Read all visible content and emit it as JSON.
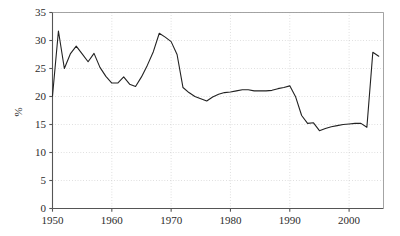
{
  "chart_data": {
    "type": "line",
    "title": "",
    "subtitle": "",
    "xlabel": "",
    "ylabel": "%",
    "xlim": [
      1950,
      2005.8
    ],
    "ylim": [
      0,
      35
    ],
    "xticks": [
      1950,
      1960,
      1970,
      1980,
      1990,
      2000
    ],
    "xtick_labels": [
      "1950",
      "1960",
      "1970",
      "1980",
      "1990",
      "2000"
    ],
    "yticks": [
      0,
      5,
      10,
      15,
      20,
      25,
      30,
      35
    ],
    "ytick_labels": [
      "0",
      "5",
      "10",
      "15",
      "20",
      "25",
      "30",
      "35"
    ],
    "grid": true,
    "grid_style": "dotted",
    "grid_color": "#c8c8c8",
    "legend": "none",
    "line_color": "#222222",
    "line_width": 1.1,
    "axis_color": "#555555",
    "background": "#ffffff",
    "x": [
      1950,
      1951,
      1952,
      1953,
      1954,
      1955,
      1956,
      1957,
      1958,
      1959,
      1960,
      1961,
      1962,
      1963,
      1964,
      1965,
      1966,
      1967,
      1968,
      1969,
      1970,
      1971,
      1972,
      1973,
      1974,
      1975,
      1976,
      1977,
      1978,
      1979,
      1980,
      1981,
      1982,
      1983,
      1984,
      1985,
      1986,
      1987,
      1988,
      1989,
      1990,
      1991,
      1992,
      1993,
      1994,
      1995,
      1996,
      1997,
      1998,
      1999,
      2000,
      2001,
      2002,
      2003,
      2004,
      2005
    ],
    "series": [
      {
        "name": "share",
        "values": [
          20.1,
          31.7,
          25.0,
          27.6,
          29.0,
          27.6,
          26.2,
          27.7,
          25.2,
          23.6,
          22.4,
          22.4,
          23.5,
          22.2,
          21.8,
          23.5,
          25.6,
          28.0,
          31.3,
          30.6,
          29.8,
          27.5,
          21.6,
          20.7,
          20.0,
          19.6,
          19.2,
          19.9,
          20.4,
          20.7,
          20.8,
          21.0,
          21.2,
          21.2,
          21.0,
          21.0,
          21.0,
          21.1,
          21.4,
          21.6,
          21.9,
          19.9,
          16.6,
          15.2,
          15.3,
          13.9,
          14.3,
          14.6,
          14.8,
          15.0,
          15.1,
          15.2,
          15.2,
          14.5,
          27.9,
          27.2
        ]
      }
    ]
  },
  "axes": {
    "y_axis_title": "%"
  }
}
